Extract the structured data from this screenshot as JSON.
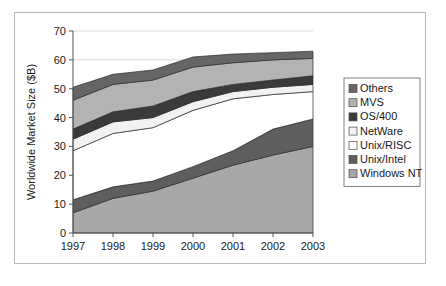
{
  "figure": {
    "border_color": "#b9b9b9",
    "background": "#ffffff"
  },
  "chart_data": {
    "type": "area",
    "stacked": true,
    "title": "",
    "xlabel": "",
    "ylabel": "Worldwide Market Size ($B)",
    "categories": [
      "1997",
      "1998",
      "1999",
      "2000",
      "2001",
      "2002",
      "2003"
    ],
    "x": [
      1997,
      1998,
      1999,
      2000,
      2001,
      2002,
      2003
    ],
    "ylim": [
      0,
      70
    ],
    "yticks": [
      0,
      10,
      20,
      30,
      40,
      50,
      60,
      70
    ],
    "ytick_labels": [
      "0",
      "10",
      "20",
      "30",
      "40",
      "50",
      "60",
      "70"
    ],
    "grid": "horizontal-light",
    "legend_position": "right",
    "stack_order_bottom_to_top": [
      "Windows NT",
      "Unix/Intel",
      "Unix/RISC",
      "NetWare",
      "OS/400",
      "MVS",
      "Others"
    ],
    "series": [
      {
        "name": "Windows NT",
        "color": "#a8a8a8",
        "values": [
          7.0,
          12.0,
          14.5,
          19.0,
          23.5,
          27.0,
          30.0
        ],
        "cumulative": [
          7.0,
          12.0,
          14.5,
          19.0,
          23.5,
          27.0,
          30.0
        ]
      },
      {
        "name": "Unix/Intel",
        "color": "#5e5e5e",
        "values": [
          4.5,
          4.0,
          3.5,
          4.0,
          5.0,
          9.0,
          9.5
        ],
        "cumulative": [
          11.5,
          16.0,
          18.0,
          23.0,
          28.5,
          36.0,
          39.5
        ]
      },
      {
        "name": "Unix/RISC",
        "color": "#ffffff",
        "values": [
          17.0,
          18.5,
          18.5,
          19.5,
          18.0,
          12.0,
          9.5
        ],
        "cumulative": [
          28.5,
          34.5,
          36.5,
          42.5,
          46.5,
          48.0,
          49.0
        ]
      },
      {
        "name": "NetWare",
        "color": "#f2f2f2",
        "values": [
          4.0,
          4.0,
          3.5,
          3.0,
          2.5,
          2.5,
          2.5
        ],
        "cumulative": [
          32.5,
          38.5,
          40.0,
          45.5,
          49.0,
          50.5,
          51.5
        ]
      },
      {
        "name": "OS/400",
        "color": "#3a3a3a",
        "values": [
          3.5,
          3.5,
          4.0,
          3.5,
          2.5,
          2.5,
          3.0
        ],
        "cumulative": [
          36.0,
          42.0,
          44.0,
          49.0,
          51.5,
          53.0,
          54.5
        ]
      },
      {
        "name": "MVS",
        "color": "#b3b3b3",
        "values": [
          10.0,
          9.5,
          9.0,
          8.5,
          7.5,
          7.0,
          6.0
        ],
        "cumulative": [
          46.0,
          51.5,
          53.0,
          57.5,
          59.0,
          60.0,
          60.5
        ]
      },
      {
        "name": "Others",
        "color": "#666666",
        "values": [
          4.5,
          3.5,
          3.5,
          3.5,
          3.0,
          2.5,
          2.5
        ],
        "cumulative": [
          50.5,
          55.0,
          56.5,
          61.0,
          62.0,
          62.5,
          63.0
        ]
      }
    ]
  },
  "legend": {
    "border_color": "#808080",
    "entries": [
      {
        "label": "Others",
        "color": "#666666"
      },
      {
        "label": "MVS",
        "color": "#b3b3b3"
      },
      {
        "label": "OS/400",
        "color": "#3a3a3a"
      },
      {
        "label": "NetWare",
        "color": "#f2f2f2"
      },
      {
        "label": "Unix/RISC",
        "color": "#ffffff"
      },
      {
        "label": "Unix/Intel",
        "color": "#5e5e5e"
      },
      {
        "label": "Windows NT",
        "color": "#a8a8a8"
      }
    ]
  }
}
